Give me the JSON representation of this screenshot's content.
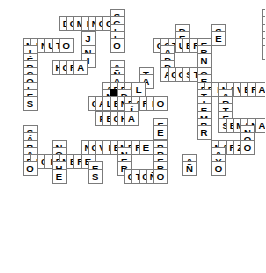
{
  "puzzle": {
    "title": "Crucigrama",
    "type": "crossword",
    "grid": {
      "cell_size": 14.5,
      "origin_x": 8,
      "origin_y": 9,
      "columns": 17,
      "rows": 18
    },
    "colors": {
      "cell_border": "#7b7b7b",
      "cell_background": "#ffffff",
      "blocked_background": "#000000",
      "letter_color": "#000000",
      "page_background": "#ffffff"
    },
    "answers": [
      {
        "word": "SEGUNDO",
        "direction": "down",
        "col": 9,
        "row": 0
      },
      {
        "word": "INVIERNO",
        "direction": "down",
        "col": 23,
        "row": 0
      },
      {
        "word": "JULIO",
        "direction": "across",
        "col": 26,
        "row": 0
      },
      {
        "word": "JUEVES",
        "direction": "down",
        "col": 26,
        "row": 0
      },
      {
        "word": "LUNES",
        "direction": "down",
        "col": 28,
        "row": 0
      },
      {
        "word": "DOMINGO",
        "direction": "across",
        "col": 5,
        "row": 1
      },
      {
        "word": "SIGLO",
        "direction": "down",
        "col": 9,
        "row": 1
      },
      {
        "word": "DECADA",
        "direction": "down",
        "col": 15,
        "row": 2
      },
      {
        "word": "VIERNES",
        "direction": "across",
        "col": 23,
        "row": 3
      },
      {
        "word": "JUNIO",
        "direction": "down",
        "col": 6,
        "row": 3
      },
      {
        "word": "MINUTO",
        "direction": "across",
        "col": 1,
        "row": 4
      },
      {
        "word": "MIERCOLES",
        "direction": "down",
        "col": 1,
        "row": 4
      },
      {
        "word": "OCTUBRE",
        "direction": "across",
        "col": 13,
        "row": 4
      },
      {
        "word": "HORA",
        "direction": "across",
        "col": 4,
        "row": 7
      },
      {
        "word": "MANANA",
        "direction": "down",
        "col": 9,
        "row": 6
      },
      {
        "word": "TARDE",
        "direction": "down",
        "col": 12,
        "row": 7
      },
      {
        "word": "AGOSTO",
        "direction": "across",
        "col": 14,
        "row": 8
      },
      {
        "word": "HOY",
        "direction": "across",
        "col": 26,
        "row": 8
      },
      {
        "word": "AYER",
        "direction": "down",
        "col": 28,
        "row": 7
      },
      {
        "word": "ABRIL",
        "direction": "across",
        "col": 9,
        "row": 9
      },
      {
        "word": "PRIMAVERA",
        "direction": "across",
        "col": 18,
        "row": 9
      },
      {
        "word": "MARTES",
        "direction": "down",
        "col": 22,
        "row": 9
      },
      {
        "word": "SEPTIEMBRE",
        "direction": "down",
        "col": 18,
        "row": 8
      },
      {
        "word": "CALENDARIO",
        "direction": "across",
        "col": 7,
        "row": 11
      },
      {
        "word": "DIA",
        "direction": "down",
        "col": 14,
        "row": 11
      },
      {
        "word": "VERANO",
        "direction": "down",
        "col": 26,
        "row": 11
      },
      {
        "word": "FECHA",
        "direction": "across",
        "col": 8,
        "row": 13
      },
      {
        "word": "SEMANA",
        "direction": "across",
        "col": 22,
        "row": 14
      },
      {
        "word": "SABADO",
        "direction": "down",
        "col": 1,
        "row": 14
      },
      {
        "word": "FEBRERO",
        "direction": "down",
        "col": 15,
        "row": 14
      },
      {
        "word": "NOCHE",
        "direction": "down",
        "col": 4,
        "row": 16
      },
      {
        "word": "NOVIEMBRE",
        "direction": "across",
        "col": 7,
        "row": 16
      },
      {
        "word": "MARZO",
        "direction": "across",
        "col": 20,
        "row": 16
      },
      {
        "word": "MAYO",
        "direction": "down",
        "col": 20,
        "row": 16
      },
      {
        "word": "MES",
        "direction": "down",
        "col": 12,
        "row": 16
      },
      {
        "word": "ENERO",
        "direction": "down",
        "col": 13,
        "row": 16
      },
      {
        "word": "DICIEMBRE",
        "direction": "across",
        "col": 1,
        "row": 18
      },
      {
        "word": "ANO",
        "direction": "down",
        "col": 18,
        "row": 18
      },
      {
        "word": "OTONO",
        "direction": "across",
        "col": 13,
        "row": 20
      }
    ],
    "cells": [
      {
        "c": 14,
        "r": 0,
        "l": "S"
      },
      {
        "c": 35,
        "r": 0,
        "l": "I"
      },
      {
        "c": 40,
        "r": 0,
        "l": "J"
      },
      {
        "c": 41,
        "r": 0,
        "l": "U"
      },
      {
        "c": 42,
        "r": 0,
        "l": "L"
      },
      {
        "c": 43,
        "r": 0,
        "l": "I"
      },
      {
        "c": 44,
        "r": 0,
        "l": "O"
      },
      {
        "c": 7,
        "r": 1,
        "l": "D"
      },
      {
        "c": 8,
        "r": 1,
        "l": "O"
      },
      {
        "c": 9,
        "r": 1,
        "l": "M"
      },
      {
        "c": 10,
        "r": 1,
        "l": "I"
      },
      {
        "c": 11,
        "r": 1,
        "l": "N"
      },
      {
        "c": 12,
        "r": 1,
        "l": "G"
      },
      {
        "c": 13,
        "r": 1,
        "l": "O"
      },
      {
        "c": 14,
        "r": 1,
        "l": "G"
      },
      {
        "c": 35,
        "r": 1,
        "l": "N"
      },
      {
        "c": 40,
        "r": 1,
        "l": "U"
      },
      {
        "c": 41,
        "r": 1,
        "l": "",
        "blocked": true
      },
      {
        "c": 42,
        "r": 1,
        "l": "U"
      },
      {
        "c": 14,
        "r": 2,
        "l": "L"
      },
      {
        "c": 23,
        "r": 2,
        "l": "D"
      },
      {
        "c": 28,
        "r": 2,
        "l": "S"
      },
      {
        "c": 35,
        "r": 2,
        "l": "V"
      },
      {
        "c": 40,
        "r": 2,
        "l": "E"
      },
      {
        "c": 42,
        "r": 2,
        "l": "N"
      },
      {
        "c": 10,
        "r": 3,
        "l": "J"
      },
      {
        "c": 14,
        "r": 3,
        "l": "L"
      },
      {
        "c": 23,
        "r": 3,
        "l": "E"
      },
      {
        "c": 28,
        "r": 3,
        "l": "E"
      },
      {
        "c": 35,
        "r": 3,
        "l": "I"
      },
      {
        "c": 36,
        "r": 3,
        "l": "E"
      },
      {
        "c": 37,
        "r": 3,
        "l": "R"
      },
      {
        "c": 38,
        "r": 3,
        "l": "N"
      },
      {
        "c": 39,
        "r": 3,
        "l": "E"
      },
      {
        "c": 40,
        "r": 3,
        "l": "S"
      },
      {
        "c": 42,
        "r": 3,
        "l": "E"
      },
      {
        "c": 2,
        "r": 4,
        "l": "M"
      },
      {
        "c": 3,
        "r": 4,
        "l": "I"
      },
      {
        "c": 4,
        "r": 4,
        "l": "N"
      },
      {
        "c": 5,
        "r": 4,
        "l": "U"
      },
      {
        "c": 6,
        "r": 4,
        "l": "T"
      },
      {
        "c": 7,
        "r": 4,
        "l": "O"
      },
      {
        "c": 14,
        "r": 4,
        "l": "O"
      },
      {
        "c": 20,
        "r": 4,
        "l": "O"
      },
      {
        "c": 21,
        "r": 4,
        "l": "C"
      },
      {
        "c": 22,
        "r": 4,
        "l": "T"
      },
      {
        "c": 23,
        "r": 4,
        "l": "U"
      },
      {
        "c": 24,
        "r": 4,
        "l": "B"
      },
      {
        "c": 25,
        "r": 4,
        "l": "R"
      },
      {
        "c": 26,
        "r": 4,
        "l": "E"
      },
      {
        "c": 35,
        "r": 4,
        "l": "E"
      },
      {
        "c": 42,
        "r": 4,
        "l": "S"
      },
      {
        "c": 2,
        "r": 5,
        "l": "I"
      },
      {
        "c": 10,
        "r": 5,
        "l": "N"
      },
      {
        "c": 21,
        "r": 5,
        "l": "A"
      },
      {
        "c": 26,
        "r": 5,
        "l": "R"
      },
      {
        "c": 35,
        "r": 5,
        "l": "S"
      },
      {
        "c": 2,
        "r": 6,
        "l": "É"
      },
      {
        "c": 10,
        "r": 6,
        "l": "I"
      },
      {
        "c": 21,
        "r": 6,
        "l": "D"
      },
      {
        "c": 26,
        "r": 6,
        "l": "N"
      },
      {
        "c": 2,
        "r": 7,
        "l": "R"
      },
      {
        "c": 6,
        "r": 7,
        "l": "H"
      },
      {
        "c": 7,
        "r": 7,
        "l": "O"
      },
      {
        "c": 8,
        "r": 7,
        "l": "R"
      },
      {
        "c": 9,
        "r": 7,
        "l": "A"
      },
      {
        "c": 14,
        "r": 7,
        "l": "A"
      },
      {
        "c": 21,
        "r": 7,
        "l": "D"
      },
      {
        "c": 41,
        "r": 7,
        "l": "A"
      },
      {
        "c": 2,
        "r": 8,
        "l": "C"
      },
      {
        "c": 14,
        "r": 8,
        "l": "Ñ"
      },
      {
        "c": 18,
        "r": 8,
        "l": "T"
      },
      {
        "c": 21,
        "r": 8,
        "l": "A"
      },
      {
        "c": 22,
        "r": 8,
        "l": "G"
      },
      {
        "c": 23,
        "r": 8,
        "l": "O"
      },
      {
        "c": 24,
        "r": 8,
        "l": "S"
      },
      {
        "c": 25,
        "r": 8,
        "l": "T"
      },
      {
        "c": 26,
        "r": 8,
        "l": "O"
      },
      {
        "c": 39,
        "r": 8,
        "l": "H"
      },
      {
        "c": 40,
        "r": 8,
        "l": "O"
      },
      {
        "c": 41,
        "r": 8,
        "l": "Y"
      },
      {
        "c": 2,
        "r": 9,
        "l": "O"
      },
      {
        "c": 14,
        "r": 9,
        "l": "A"
      },
      {
        "c": 18,
        "r": 9,
        "l": "A"
      },
      {
        "c": 26,
        "r": 9,
        "l": "E"
      },
      {
        "c": 41,
        "r": 9,
        "l": "E"
      },
      {
        "c": 2,
        "r": 10,
        "l": "L"
      },
      {
        "c": 13,
        "r": 10,
        "l": "A"
      },
      {
        "c": 14,
        "r": 10,
        "l": "B"
      },
      {
        "c": 15,
        "r": 10,
        "l": "R"
      },
      {
        "c": 16,
        "r": 10,
        "l": "I"
      },
      {
        "c": 17,
        "r": 10,
        "l": "L"
      },
      {
        "c": 26,
        "r": 10,
        "l": "P"
      },
      {
        "c": 27,
        "r": 10,
        "l": "R"
      },
      {
        "c": 28,
        "r": 10,
        "l": "I"
      },
      {
        "c": 29,
        "r": 10,
        "l": "M"
      },
      {
        "c": 30,
        "r": 10,
        "l": "A"
      },
      {
        "c": 31,
        "r": 10,
        "l": "V"
      },
      {
        "c": 32,
        "r": 10,
        "l": "E"
      },
      {
        "c": 33,
        "r": 10,
        "l": "R"
      },
      {
        "c": 34,
        "r": 10,
        "l": "A"
      },
      {
        "c": 41,
        "r": 10,
        "l": "R"
      },
      {
        "c": 2,
        "r": 11,
        "l": "E"
      },
      {
        "c": 13,
        "r": 11,
        "l": "N"
      },
      {
        "c": 14,
        "r": 11,
        "l": "",
        "blocked": true
      },
      {
        "c": 15,
        "r": 11,
        "l": "D"
      },
      {
        "c": 26,
        "r": 11,
        "l": "T"
      },
      {
        "c": 29,
        "r": 11,
        "l": "A"
      },
      {
        "c": 2,
        "r": 12,
        "l": "S"
      },
      {
        "c": 11,
        "r": 12,
        "l": "C"
      },
      {
        "c": 12,
        "r": 12,
        "l": "A"
      },
      {
        "c": 13,
        "r": 12,
        "l": "L"
      },
      {
        "c": 14,
        "r": 12,
        "l": "E"
      },
      {
        "c": 15,
        "r": 12,
        "l": "N"
      },
      {
        "c": 16,
        "r": 12,
        "l": "D"
      },
      {
        "c": 17,
        "r": 12,
        "l": "A"
      },
      {
        "c": 18,
        "r": 12,
        "l": "R"
      },
      {
        "c": 19,
        "r": 12,
        "l": "I"
      },
      {
        "c": 20,
        "r": 12,
        "l": "O"
      },
      {
        "c": 26,
        "r": 12,
        "l": "I"
      },
      {
        "c": 29,
        "r": 12,
        "l": "R"
      },
      {
        "c": 38,
        "r": 12,
        "l": "V"
      },
      {
        "c": 16,
        "r": 13,
        "l": "Í"
      },
      {
        "c": 26,
        "r": 13,
        "l": "E"
      },
      {
        "c": 29,
        "r": 13,
        "l": "T"
      },
      {
        "c": 38,
        "r": 13,
        "l": "E"
      },
      {
        "c": 12,
        "r": 14,
        "l": "F"
      },
      {
        "c": 13,
        "r": 14,
        "l": "E"
      },
      {
        "c": 14,
        "r": 14,
        "l": "C"
      },
      {
        "c": 15,
        "r": 14,
        "l": "H"
      },
      {
        "c": 16,
        "r": 14,
        "l": "A"
      },
      {
        "c": 26,
        "r": 14,
        "l": "M"
      },
      {
        "c": 29,
        "r": 14,
        "l": "E"
      },
      {
        "c": 38,
        "r": 14,
        "l": "R"
      },
      {
        "c": 20,
        "r": 15,
        "l": "F"
      },
      {
        "c": 26,
        "r": 15,
        "l": "B"
      },
      {
        "c": 29,
        "r": 15,
        "l": "S"
      },
      {
        "c": 30,
        "r": 15,
        "l": "E"
      },
      {
        "c": 31,
        "r": 15,
        "l": "M"
      },
      {
        "c": 32,
        "r": 15,
        "l": "A"
      },
      {
        "c": 33,
        "r": 15,
        "l": "N"
      },
      {
        "c": 34,
        "r": 15,
        "l": "A"
      },
      {
        "c": 2,
        "r": 16,
        "l": "S"
      },
      {
        "c": 20,
        "r": 16,
        "l": "E"
      },
      {
        "c": 26,
        "r": 16,
        "l": "R"
      },
      {
        "c": 32,
        "r": 16,
        "l": "N"
      },
      {
        "c": 2,
        "r": 17,
        "l": "Á"
      },
      {
        "c": 32,
        "r": 17,
        "l": "O"
      },
      {
        "c": 2,
        "r": 18,
        "l": "B"
      },
      {
        "c": 6,
        "r": 18,
        "l": "N"
      },
      {
        "c": 10,
        "r": 18,
        "l": "N"
      },
      {
        "c": 11,
        "r": 18,
        "l": "O"
      },
      {
        "c": 12,
        "r": 18,
        "l": "V"
      },
      {
        "c": 13,
        "r": 18,
        "l": "I"
      },
      {
        "c": 14,
        "r": 18,
        "l": "E"
      },
      {
        "c": 15,
        "r": 18,
        "l": "M"
      },
      {
        "c": 16,
        "r": 18,
        "l": "B"
      },
      {
        "c": 17,
        "r": 18,
        "l": "R"
      },
      {
        "c": 18,
        "r": 18,
        "l": "E"
      },
      {
        "c": 20,
        "r": 18,
        "l": "B"
      },
      {
        "c": 28,
        "r": 18,
        "l": "M"
      },
      {
        "c": 29,
        "r": 18,
        "l": "A"
      },
      {
        "c": 30,
        "r": 18,
        "l": "R"
      },
      {
        "c": 31,
        "r": 18,
        "l": "Z"
      },
      {
        "c": 32,
        "r": 18,
        "l": "O"
      },
      {
        "c": 2,
        "r": 19,
        "l": "A"
      },
      {
        "c": 6,
        "r": 19,
        "l": "O"
      },
      {
        "c": 15,
        "r": 19,
        "l": "N"
      },
      {
        "c": 20,
        "r": 19,
        "l": "R"
      },
      {
        "c": 28,
        "r": 19,
        "l": "A"
      },
      {
        "c": 2,
        "r": 20,
        "l": "D"
      },
      {
        "c": 3,
        "r": 20,
        "l": "I"
      },
      {
        "c": 4,
        "r": 20,
        "l": "C"
      },
      {
        "c": 5,
        "r": 20,
        "l": "I"
      },
      {
        "c": 6,
        "r": 20,
        "l": "E"
      },
      {
        "c": 7,
        "r": 20,
        "l": "M"
      },
      {
        "c": 8,
        "r": 20,
        "l": "B"
      },
      {
        "c": 9,
        "r": 20,
        "l": "R"
      },
      {
        "c": 10,
        "r": 20,
        "l": "E"
      },
      {
        "c": 15,
        "r": 20,
        "l": "E"
      },
      {
        "c": 20,
        "r": 20,
        "l": "E"
      },
      {
        "c": 24,
        "r": 20,
        "l": "A"
      },
      {
        "c": 28,
        "r": 20,
        "l": "Y"
      },
      {
        "c": 2,
        "r": 21,
        "l": "O"
      },
      {
        "c": 6,
        "r": 21,
        "l": "H"
      },
      {
        "c": 11,
        "r": 21,
        "l": "E"
      },
      {
        "c": 15,
        "r": 21,
        "l": "R"
      },
      {
        "c": 20,
        "r": 21,
        "l": "R"
      },
      {
        "c": 24,
        "r": 21,
        "l": "Ñ"
      },
      {
        "c": 28,
        "r": 21,
        "l": "O"
      },
      {
        "c": 6,
        "r": 22,
        "l": "E"
      },
      {
        "c": 11,
        "r": 22,
        "l": "S"
      },
      {
        "c": 16,
        "r": 22,
        "l": "O"
      },
      {
        "c": 17,
        "r": 22,
        "l": "T"
      },
      {
        "c": 18,
        "r": 22,
        "l": "O"
      },
      {
        "c": 19,
        "r": 22,
        "l": "Ñ"
      },
      {
        "c": 20,
        "r": 22,
        "l": "O"
      }
    ]
  }
}
